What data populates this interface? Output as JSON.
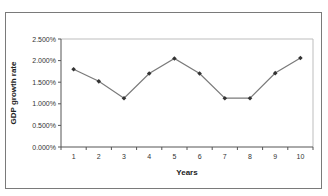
{
  "chart_data": {
    "type": "line",
    "title": "",
    "xlabel": "Years",
    "ylabel": "GDP growth rate",
    "categories": [
      "1",
      "2",
      "3",
      "4",
      "5",
      "6",
      "7",
      "8",
      "9",
      "10"
    ],
    "series": [
      {
        "name": "GDP growth rate",
        "values": [
          1.8,
          1.52,
          1.13,
          1.7,
          2.05,
          1.7,
          1.13,
          1.13,
          1.71,
          2.06
        ]
      }
    ],
    "ylim": [
      0,
      2.5
    ],
    "yticks": [
      0,
      0.5,
      1.0,
      1.5,
      2.0,
      2.5
    ],
    "ytick_labels": [
      "0.000%",
      "0.500%",
      "1.000%",
      "1.500%",
      "2.000%",
      "2.500%"
    ],
    "grid": false,
    "legend": "none",
    "marker": "diamond",
    "colors": {
      "line": "#7a7a7a",
      "marker": "#333333",
      "axis": "#555555",
      "plot_border": "#bdbdbd"
    }
  }
}
